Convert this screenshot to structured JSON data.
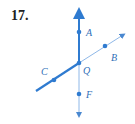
{
  "problem": {
    "number": "17."
  },
  "diagram": {
    "colors": {
      "thick": "#2f7bd0",
      "thin": "#8fb8e8",
      "point": "#2f7bd0",
      "label": "#2f6fb8"
    },
    "points": [
      {
        "name": "A",
        "label": "A"
      },
      {
        "name": "B",
        "label": "B"
      },
      {
        "name": "C",
        "label": "C"
      },
      {
        "name": "Q",
        "label": "Q"
      },
      {
        "name": "F",
        "label": "F"
      }
    ],
    "rays": [
      {
        "from": "Q",
        "through": "A",
        "style": "thick"
      },
      {
        "from": "Q",
        "through": "C",
        "style": "thick"
      },
      {
        "from": "Q",
        "through": "B",
        "style": "thin"
      },
      {
        "from": "Q",
        "through": "F",
        "style": "thin"
      }
    ]
  }
}
